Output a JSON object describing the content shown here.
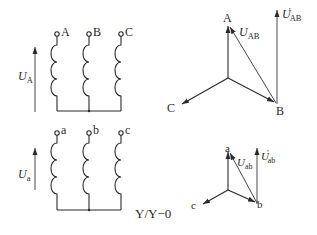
{
  "hv_windings": {
    "terminals": [
      {
        "label": "A",
        "x": 57
      },
      {
        "label": "B",
        "x": 89
      },
      {
        "label": "C",
        "x": 121
      }
    ],
    "voltage_label": {
      "main": "U",
      "sub": "A"
    }
  },
  "lv_windings": {
    "terminals": [
      {
        "label": "a",
        "x": 57
      },
      {
        "label": "b",
        "x": 89
      },
      {
        "label": "c",
        "x": 121
      }
    ],
    "voltage_label": {
      "main": "U",
      "sub": "a"
    }
  },
  "hv_phasor": {
    "points": {
      "A": "A",
      "B": "B",
      "C": "C"
    },
    "line_voltage": {
      "main": "U",
      "sub": "AB"
    },
    "shifted_voltage": {
      "main": "U",
      "prime": "′",
      "sub": "AB"
    }
  },
  "lv_phasor": {
    "points": {
      "a": "a",
      "b": "b",
      "c": "c"
    },
    "line_voltage": {
      "main": "U",
      "sub": "ab"
    },
    "shifted_voltage": {
      "main": "U",
      "prime": "′",
      "sub": "ab"
    }
  },
  "connection_group": "Y/Y−0"
}
